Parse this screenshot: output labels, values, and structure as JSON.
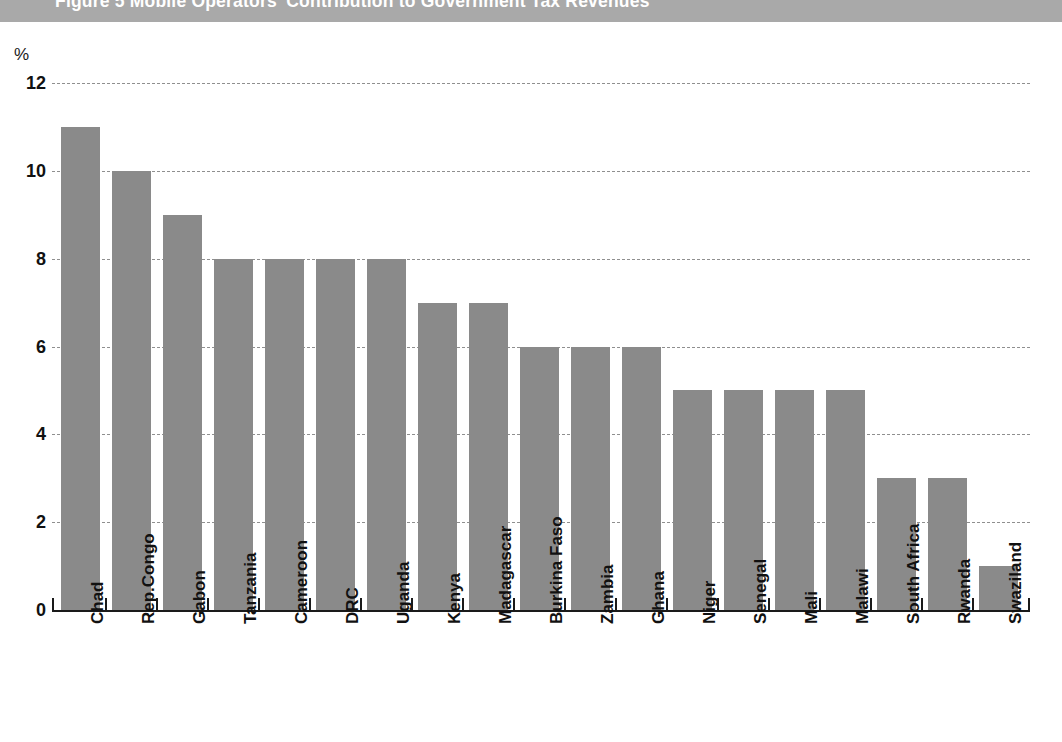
{
  "figure": {
    "title": "Figure 5  Mobile Operators' Contribution to Government Tax Revenues"
  },
  "axis": {
    "unit_label": "%",
    "y_ticks": [
      "0",
      "2",
      "4",
      "6",
      "8",
      "10",
      "12"
    ]
  },
  "colors": {
    "bar_fill": "#8a8a8a",
    "title_band": "#a9a9a9",
    "title_text": "#ffffff",
    "gridline": "#8f8f8f",
    "axis": "#1a1a1a"
  },
  "chart_data": {
    "type": "bar",
    "title": "Figure 5  Mobile Operators' Contribution to Government Tax Revenues",
    "xlabel": "",
    "ylabel": "%",
    "ylim": [
      0,
      12
    ],
    "yticks": [
      0,
      2,
      4,
      6,
      8,
      10,
      12
    ],
    "grid": true,
    "legend": "none",
    "categories": [
      "Chad",
      "Rep.Congo",
      "Gabon",
      "Tanzania",
      "Cameroon",
      "DRC",
      "Uganda",
      "Kenya",
      "Madagascar",
      "Burkina Faso",
      "Zambia",
      "Ghana",
      "Niger",
      "Senegal",
      "Mali",
      "Malawi",
      "South Africa",
      "Rwanda",
      "Swaziland"
    ],
    "values": [
      11,
      10,
      9,
      8,
      8,
      8,
      8,
      7,
      7,
      6,
      6,
      6,
      5,
      5,
      5,
      5,
      3,
      3,
      1
    ]
  }
}
